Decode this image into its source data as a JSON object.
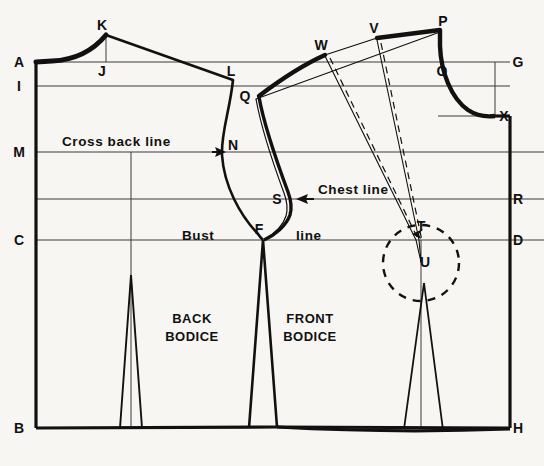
{
  "figure": {
    "background_color": "#f7f6f2",
    "ink_color": "#111111",
    "width": 544,
    "height": 466
  },
  "chart_data": {
    "type": "diagram",
    "xlim": [
      0,
      544
    ],
    "ylim": [
      0,
      466
    ],
    "grid": false,
    "guide_lines": [
      {
        "name": "A-G top line",
        "label_left": "A",
        "label_right": "G",
        "y": 62,
        "x_start": 36,
        "x_end": 510
      },
      {
        "name": "I-line",
        "label_left": "I",
        "label_right": "",
        "y": 86,
        "x_start": 36,
        "x_end": 510
      },
      {
        "name": "cross back line",
        "label_left": "M",
        "label_right": "",
        "y": 152,
        "x_start": 36,
        "x_end": 510
      },
      {
        "name": "chest line",
        "label_left": "",
        "label_right": "R",
        "y": 199,
        "x_start": 36,
        "x_end": 510
      },
      {
        "name": "bust line",
        "label_left": "C",
        "label_right": "D",
        "y": 240,
        "x_start": 36,
        "x_end": 510
      },
      {
        "name": "waist line",
        "label_left": "B",
        "label_right": "H",
        "y": 428,
        "x_start": 36,
        "x_end": 510
      }
    ],
    "points": [
      {
        "id": "A",
        "x": 36,
        "y": 62,
        "label_dx": -17,
        "label_dy": 5,
        "desc": "back centre top"
      },
      {
        "id": "B",
        "x": 36,
        "y": 428,
        "label_dx": -17,
        "label_dy": 5,
        "desc": "back centre waist"
      },
      {
        "id": "C",
        "x": 36,
        "y": 240,
        "label_dx": -17,
        "label_dy": 5,
        "desc": "back centre bust"
      },
      {
        "id": "D",
        "x": 510,
        "y": 240,
        "label_dx": 8,
        "label_dy": 5,
        "desc": "front centre bust"
      },
      {
        "id": "F",
        "x": 263,
        "y": 240,
        "label_dx": -4,
        "label_dy": -6,
        "desc": "underarm point"
      },
      {
        "id": "G",
        "x": 510,
        "y": 62,
        "label_dx": 8,
        "label_dy": 5,
        "desc": "front centre top"
      },
      {
        "id": "H",
        "x": 510,
        "y": 428,
        "label_dx": 8,
        "label_dy": 5,
        "desc": "front centre waist"
      },
      {
        "id": "I",
        "x": 36,
        "y": 86,
        "label_dx": -17,
        "label_dy": 5,
        "desc": "back neck depth"
      },
      {
        "id": "J",
        "x": 106,
        "y": 62,
        "label_dx": -4,
        "label_dy": 14,
        "desc": "back shoulder base"
      },
      {
        "id": "K",
        "x": 106,
        "y": 35,
        "label_dx": -4,
        "label_dy": -5,
        "desc": "back shoulder tip rise"
      },
      {
        "id": "L",
        "x": 233,
        "y": 80,
        "label_dx": -2,
        "label_dy": -4,
        "desc": "back shoulder end"
      },
      {
        "id": "M",
        "x": 36,
        "y": 152,
        "label_dx": -17,
        "label_dy": 5,
        "desc": "cross back line at centre back"
      },
      {
        "id": "N",
        "x": 227,
        "y": 152,
        "label_dx": 6,
        "label_dy": -2,
        "desc": "cross back point on armhole"
      },
      {
        "id": "O",
        "x": 438,
        "y": 62,
        "label_dx": 4,
        "label_dy": 14,
        "desc": "front neck shoulder point"
      },
      {
        "id": "P",
        "x": 440,
        "y": 30,
        "label_dx": 3,
        "label_dy": -4,
        "desc": "front shoulder neck top"
      },
      {
        "id": "Q",
        "x": 259,
        "y": 97,
        "label_dx": -14,
        "label_dy": 4,
        "desc": "front shoulder end"
      },
      {
        "id": "R",
        "x": 510,
        "y": 199,
        "label_dx": 8,
        "label_dy": 5,
        "desc": "chest line at centre front"
      },
      {
        "id": "S",
        "x": 291,
        "y": 199,
        "label_dx": -14,
        "label_dy": 5,
        "desc": "chest point on front armhole"
      },
      {
        "id": "T",
        "x": 418,
        "y": 231,
        "label_dx": 3,
        "label_dy": 0,
        "desc": "dart apex reference"
      },
      {
        "id": "U",
        "x": 421,
        "y": 263,
        "label_dx": 4,
        "label_dy": 4,
        "desc": "bust point"
      },
      {
        "id": "V",
        "x": 377,
        "y": 38,
        "label_dx": -3,
        "label_dy": -5,
        "desc": "shoulder dart leg"
      },
      {
        "id": "W",
        "x": 325,
        "y": 55,
        "label_dx": -4,
        "label_dy": -5,
        "desc": "shoulder dart leg"
      },
      {
        "id": "X",
        "x": 495,
        "y": 116,
        "label_dx": 9,
        "label_dy": 5,
        "desc": "front neck depth"
      }
    ],
    "annotations": [
      {
        "id": "cross-back-line",
        "text": "Cross back line",
        "x": 62,
        "y": 146,
        "arrow_to": [
          223,
          152
        ]
      },
      {
        "id": "chest-line",
        "text": "Chest  line",
        "x": 318,
        "y": 194,
        "arrow_to": [
          295,
          199
        ]
      },
      {
        "id": "bust-line",
        "text": "Bust",
        "x": 182,
        "y": 240,
        "arrow_to": null
      },
      {
        "id": "bust-line-2",
        "text": "line",
        "x": 296,
        "y": 240,
        "arrow_to": null
      }
    ],
    "piece_labels": [
      {
        "id": "back-bodice",
        "line1": "BACK",
        "line2": "BODICE",
        "x": 192,
        "y": 323
      },
      {
        "id": "front-bodice",
        "line1": "FRONT",
        "line2": "BODICE",
        "x": 310,
        "y": 323
      }
    ],
    "darts": [
      {
        "name": "back waist dart",
        "apex_x": 131,
        "apex_y": 275,
        "left_x": 120,
        "right_x": 142,
        "base_y": 428
      },
      {
        "name": "side underarm dart",
        "apex_x": 263,
        "apex_y": 240,
        "left_x": 249,
        "right_x": 277,
        "base_y": 428
      },
      {
        "name": "front waist dart",
        "apex_x": 424,
        "apex_y": 283,
        "left_x": 404,
        "right_x": 443,
        "base_y": 428
      },
      {
        "name": "shoulder dart",
        "from": "W",
        "to": "V",
        "apex": "U"
      }
    ],
    "bust_circle": {
      "cx": 421,
      "cy": 263,
      "r": 38,
      "style": "dashed"
    }
  }
}
